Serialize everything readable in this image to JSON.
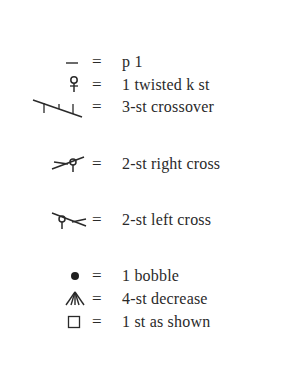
{
  "legend": {
    "items": [
      {
        "symbol": "purl-dash-icon",
        "equals": "=",
        "label": "p 1"
      },
      {
        "symbol": "twisted-knit-icon",
        "equals": "=",
        "label": "1 twisted k st"
      },
      {
        "symbol": "three-st-crossover-icon",
        "equals": "=",
        "label": "3-st crossover"
      },
      {
        "symbol": "right-cross-icon",
        "equals": "=",
        "label": "2-st right cross"
      },
      {
        "symbol": "left-cross-icon",
        "equals": "=",
        "label": "2-st left cross"
      },
      {
        "symbol": "bobble-dot-icon",
        "equals": "=",
        "label": "1 bobble"
      },
      {
        "symbol": "four-st-decrease-icon",
        "equals": "=",
        "label": "4-st decrease"
      },
      {
        "symbol": "empty-square-icon",
        "equals": "=",
        "label": "1 st as shown"
      }
    ]
  }
}
